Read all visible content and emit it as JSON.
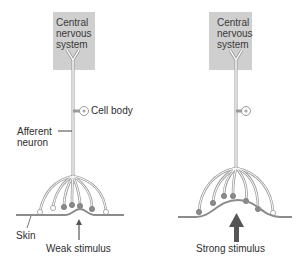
{
  "panels": [
    {
      "id": "weak",
      "cns_label": "Central nervous system",
      "cns_lines": [
        "Central",
        "nervous",
        "system"
      ],
      "stimulus_label": "Weak stimulus",
      "stimulus_strength": "weak"
    },
    {
      "id": "strong",
      "cns_label": "Central nervous system",
      "cns_lines": [
        "Central",
        "nervous",
        "system"
      ],
      "stimulus_label": "Strong stimulus",
      "stimulus_strength": "strong"
    }
  ],
  "labels": {
    "cell_body": "Cell body",
    "afferent_neuron_line1": "Afferent",
    "afferent_neuron_line2": "neuron",
    "skin": "Skin"
  },
  "colors": {
    "cns_box": "#cfcfcf",
    "neuron_outline": "#9a9a9a",
    "activated_receptor": "#8a8a8a",
    "inactive_receptor": "#ffffff",
    "arrow": "#555555",
    "skin_line": "#8c8c8c"
  }
}
